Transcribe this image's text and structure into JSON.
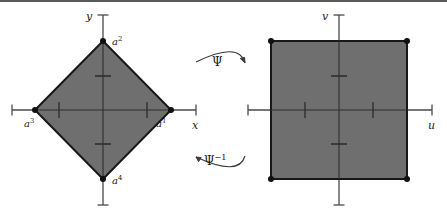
{
  "figure": {
    "width": 447,
    "height": 218,
    "background": "#ffffff",
    "top_rule_color": "#5b5b5b",
    "shape_fill": "#706f6f",
    "shape_stroke": "#181818",
    "axis_color": "#4a4a4a",
    "vertex_dot_color": "#101010",
    "arrow_color": "#3c3c3c"
  },
  "left_plot": {
    "name": "xy-plane-diamond",
    "axis_labels": {
      "x": "x",
      "y": "y"
    },
    "origin": {
      "x": 103,
      "y": 110
    },
    "shape": {
      "type": "diamond",
      "vertices": [
        {
          "label_base": "a",
          "label_sup": "1",
          "x": 171,
          "y": 110
        },
        {
          "label_base": "a",
          "label_sup": "2",
          "x": 103,
          "y": 41
        },
        {
          "label_base": "a",
          "label_sup": "3",
          "x": 35,
          "y": 110
        },
        {
          "label_base": "a",
          "label_sup": "4",
          "x": 103,
          "y": 179
        }
      ]
    },
    "x_axis": {
      "start": 12,
      "end": 196,
      "ticks": [
        59,
        147
      ]
    },
    "y_axis": {
      "start": 15,
      "end": 205,
      "ticks": [
        76,
        144
      ]
    }
  },
  "right_plot": {
    "name": "uv-plane-square",
    "axis_labels": {
      "u": "u",
      "v": "v"
    },
    "origin": {
      "x": 339,
      "y": 110
    },
    "shape": {
      "type": "square",
      "corners": [
        {
          "x": 271,
          "y": 41
        },
        {
          "x": 407,
          "y": 41
        },
        {
          "x": 407,
          "y": 179
        },
        {
          "x": 271,
          "y": 179
        }
      ]
    },
    "u_axis": {
      "start": 248,
      "end": 432,
      "ticks": [
        305,
        373
      ]
    },
    "v_axis": {
      "start": 15,
      "end": 205,
      "ticks": [
        76,
        144
      ]
    }
  },
  "maps": {
    "forward": {
      "base": "Ψ",
      "sup": "",
      "direction": "right"
    },
    "inverse": {
      "base": "Ψ",
      "sup": "−1",
      "direction": "left"
    }
  }
}
